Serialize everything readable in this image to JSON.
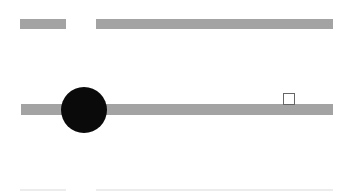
{
  "header": {
    "label_placeholder": {
      "color": "#a3a3a3"
    },
    "value_placeholder": {
      "color": "#a3a3a3"
    }
  },
  "slider": {
    "track_color": "#a3a3a3",
    "thumb_color": "#0a0a0a",
    "thumb_position_percent": 20
  },
  "checkbox": {
    "checked": false,
    "border_color": "#666666"
  },
  "footer": {
    "placeholder_color": "#ececec"
  }
}
